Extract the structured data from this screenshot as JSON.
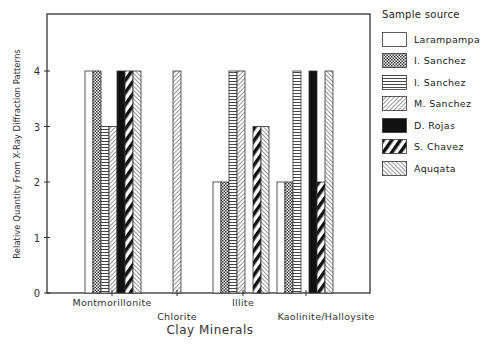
{
  "chart_data": {
    "type": "bar",
    "title": "",
    "xlabel": "Clay Minerals",
    "ylabel": "Relative Quantity From X-Ray Diffraction Patterns",
    "ylim": [
      0,
      5
    ],
    "yticks": [
      0,
      1,
      2,
      3,
      4
    ],
    "grid": false,
    "legend_position": "right",
    "legend_title": "Sample source",
    "categories": [
      "Montmorillonite",
      "Chlorite",
      "Illite",
      "Kaolinite/Halloysite"
    ],
    "series": [
      {
        "name": "Larampampa",
        "pattern": "empty",
        "values": [
          4,
          0,
          2,
          2
        ]
      },
      {
        "name": "I. Sanchez",
        "pattern": "crosshatch",
        "values": [
          4,
          0,
          2,
          2
        ]
      },
      {
        "name": "I. Sanchez",
        "pattern": "horizontal",
        "values": [
          3,
          0,
          4,
          4
        ]
      },
      {
        "name": "M. Sanchez",
        "pattern": "diagonal-fine",
        "values": [
          3,
          4,
          4,
          0
        ]
      },
      {
        "name": "D. Rojas",
        "pattern": "solid",
        "values": [
          4,
          0,
          0,
          4
        ]
      },
      {
        "name": "S. Chavez",
        "pattern": "diagonal-thick",
        "values": [
          4,
          0,
          3,
          2
        ]
      },
      {
        "name": "Aquqata",
        "pattern": "backslash-fine",
        "values": [
          4,
          0,
          3,
          4
        ]
      }
    ]
  },
  "labels": {
    "legend_title": "Sample source",
    "xlabel": "Clay Minerals",
    "ylabel": "Relative Quantity From X-Ray Diffraction Patterns",
    "categories": [
      "Montmorillonite",
      "Chlorite",
      "Illite",
      "Kaolinite/Halloysite"
    ],
    "legend": [
      "Larampampa",
      "I. Sanchez",
      "I. Sanchez",
      "M. Sanchez",
      "D. Rojas",
      "S. Chavez",
      "Aquqata"
    ]
  }
}
